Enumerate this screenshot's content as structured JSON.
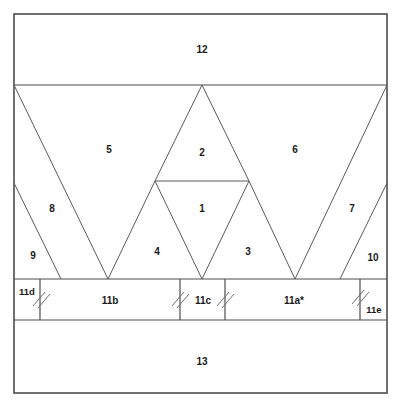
{
  "figure": {
    "line_color": "#4d4d4d",
    "background_color": "#ffffff",
    "text_color": "#1a1a1a"
  },
  "frame": {
    "x": 14,
    "y": 14,
    "width": 373,
    "height": 379
  },
  "bands": {
    "top": {
      "label": "12",
      "y_top": 14,
      "y_bottom": 85,
      "label_x": 202,
      "label_y": 50
    },
    "triangles": {
      "y_top": 85,
      "y_bottom": 279
    },
    "middle": {
      "y_top": 279,
      "y_bottom": 320
    },
    "bottom": {
      "label": "13",
      "y_top": 320,
      "y_bottom": 393,
      "label_x": 202,
      "label_y": 362
    }
  },
  "middle_band_segments": [
    {
      "label": "11d",
      "x_start": 14,
      "x_end": 40,
      "label_x": 27,
      "label_y": 292
    },
    {
      "label": "11b",
      "x_start": 40,
      "x_end": 180,
      "label_x": 110,
      "label_y": 301
    },
    {
      "label": "11c",
      "x_start": 180,
      "x_end": 225,
      "label_x": 203,
      "label_y": 301
    },
    {
      "label": "11a*",
      "x_start": 225,
      "x_end": 360,
      "label_x": 294,
      "label_y": 301
    },
    {
      "label": "11e",
      "x_start": 360,
      "x_end": 387,
      "label_x": 374,
      "label_y": 310
    }
  ],
  "middle_band_dividers": [
    40,
    180,
    225,
    360
  ],
  "hatch_marks": [
    {
      "x": 40,
      "y": 299
    },
    {
      "x": 180,
      "y": 299
    },
    {
      "x": 225,
      "y": 299
    },
    {
      "x": 360,
      "y": 297
    }
  ],
  "triangle_regions": [
    {
      "label": "1",
      "label_x": 202,
      "label_y": 209
    },
    {
      "label": "2",
      "label_x": 202,
      "label_y": 153
    },
    {
      "label": "3",
      "label_x": 248,
      "label_y": 252
    },
    {
      "label": "4",
      "label_x": 157,
      "label_y": 252
    },
    {
      "label": "5",
      "label_x": 109,
      "label_y": 150
    },
    {
      "label": "6",
      "label_x": 295,
      "label_y": 150
    },
    {
      "label": "7",
      "label_x": 352,
      "label_y": 209
    },
    {
      "label": "8",
      "label_x": 52,
      "label_y": 209
    },
    {
      "label": "9",
      "label_x": 33,
      "label_y": 256
    },
    {
      "label": "10",
      "label_x": 373,
      "label_y": 258
    }
  ],
  "triangle_vertices": {
    "region_top_y": 85,
    "region_bottom_y": 279,
    "bottom_vertices_x": [
      108,
      202,
      295
    ],
    "apex_x": 202,
    "apex_y": 85,
    "inner_line_y": 181,
    "inner_line_x_start": 155,
    "inner_line_x_end": 249,
    "left_edge_point_y": 183,
    "right_edge_point_y": 183
  },
  "geometry_paths": {
    "left_outer_diagonal": "M14,85 L108,279",
    "left_inner_diagonal": "M14,183 L61,279",
    "tri5_right": "M108,279 L155,181",
    "tri2_left": "M155,181 L202,85",
    "tri2_right": "M202,85 L249,181",
    "tri1_left": "M155,181 L202,279",
    "tri1_right": "M202,279 L249,181",
    "tri3_right": "M249,181 L295,279",
    "right_outer_diagonal": "M295,279 L387,85",
    "right_inner_diagonal": "M340,279 L387,183",
    "inner_horizontal": "M155,181 L249,181"
  }
}
